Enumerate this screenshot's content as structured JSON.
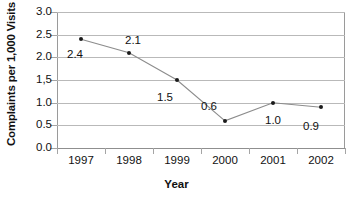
{
  "chart_data": {
    "type": "line",
    "title": "",
    "xlabel": "Year",
    "ylabel": "Complaints per 1,000 Visits",
    "categories": [
      "1997",
      "1998",
      "1999",
      "2000",
      "2001",
      "2002"
    ],
    "values": [
      2.4,
      2.1,
      1.5,
      0.6,
      1.0,
      0.9
    ],
    "point_labels": [
      "2.4",
      "2.1",
      "1.5",
      "0.6",
      "1.0",
      "0.9"
    ],
    "ylim": [
      0.0,
      3.0
    ],
    "ytick_labels": [
      "3.0",
      "2.5",
      "2.0",
      "1,5",
      "1.0",
      "0.5",
      "0.0"
    ],
    "ytick_values": [
      3.0,
      2.5,
      2.0,
      1.5,
      1.0,
      0.5,
      0.0
    ],
    "grid": true,
    "legend": "none",
    "marker": "dot",
    "line_color": "#8c8c8c",
    "marker_color": "#1a1a1a",
    "grid_color": "#b9b9b9",
    "text_color": "#111111"
  }
}
